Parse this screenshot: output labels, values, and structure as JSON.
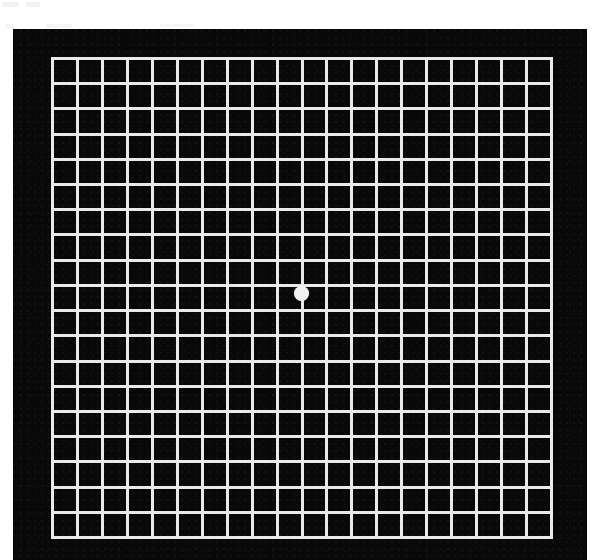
{
  "figure": {
    "background_color": "#ffffff",
    "card_color": "#080808",
    "line_color": "#e9e9e9",
    "dot_color": "#f2f2f2"
  },
  "chart_data": {
    "type": "heatmap",
    "subtitle": "",
    "xlabel": "",
    "ylabel": "",
    "grid": true,
    "legend_position": "none",
    "categories": [],
    "values": [],
    "layout": {
      "canvas_width": 593,
      "canvas_height": 560,
      "card_left": 13,
      "card_top": 29,
      "card_width": 580,
      "card_height": 531,
      "grid_left": 51,
      "grid_top": 57,
      "grid_width": 502,
      "grid_height": 482,
      "columns": 20,
      "rows": 19,
      "cell_width": 25.1,
      "cell_height": 25.4,
      "line_width_px": 3
    },
    "annotations": [
      {
        "name": "central-fixation-dot",
        "shape": "circle",
        "x": 301,
        "y": 293,
        "diameter_px": 15,
        "color": "#f2f2f2",
        "grid_column_index": 10,
        "grid_row_index": 9
      }
    ]
  },
  "artifacts": {
    "smudges": [
      {
        "x": 3,
        "y": 2,
        "w": 16,
        "h": 5
      },
      {
        "x": 26,
        "y": 2,
        "w": 14,
        "h": 5
      },
      {
        "x": 5,
        "y": 24,
        "w": 10,
        "h": 4
      },
      {
        "x": 46,
        "y": 24,
        "w": 26,
        "h": 4
      },
      {
        "x": 160,
        "y": 24,
        "w": 34,
        "h": 3
      }
    ]
  }
}
